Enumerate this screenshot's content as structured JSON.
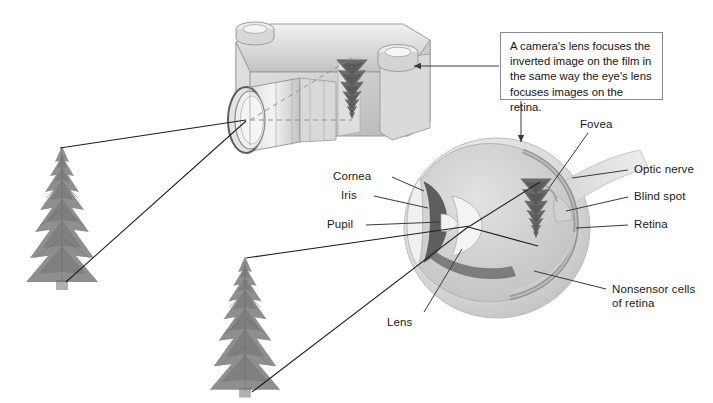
{
  "figure": {
    "caption": "A camera's lens focuses the inverted image on the film in the same way the eye's lens focuses images on the retina.",
    "caption_lines": [
      "A camera's lens focuses the",
      "inverted image on the film in",
      "the same way the eye's lens",
      "focuses images on the retina."
    ]
  },
  "labels": {
    "cornea": "Cornea",
    "iris": "Iris",
    "pupil": "Pupil",
    "lens": "Lens",
    "fovea": "Fovea",
    "optic_nerve": "Optic nerve",
    "blind_spot": "Blind spot",
    "retina": "Retina",
    "nonsensor_line1": "Nonsensor cells",
    "nonsensor_line2": "of retina"
  },
  "objects": {
    "camera": "camera-illustration",
    "eye": "eye-illustration",
    "tree_left": "tree-object-left",
    "tree_bottom": "tree-object-bottom",
    "film_image": "inverted-tree-image-on-film",
    "retina_image": "inverted-tree-image-on-retina"
  },
  "colors": {
    "ink": "#1a1a1a",
    "box_border": "#8a8a8a",
    "leader": "#222222",
    "body_light": "#e6e6e6",
    "body_mid": "#c9c9c9",
    "body_dark": "#9a9a9a",
    "iris_dark": "#5a5a5a",
    "tree": "#8b8b8b",
    "background": "#ffffff"
  }
}
